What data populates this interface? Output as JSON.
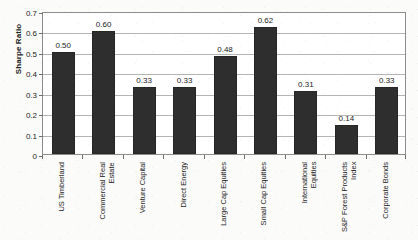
{
  "chart_data": {
    "type": "bar",
    "title": "",
    "xlabel": "",
    "ylabel": "Sharpe Ratio",
    "ylim": [
      0,
      0.7
    ],
    "ytick_step": 0.1,
    "ytick_labels": [
      "0.7",
      "0.6",
      "0.5",
      "0.4",
      "0.3",
      "0.2",
      "0.1",
      "0"
    ],
    "ytick_values": [
      0.7,
      0.6,
      0.5,
      0.4,
      0.3,
      0.2,
      0.1,
      0
    ],
    "grid": "horizontal",
    "legend": "none",
    "bar_color": "#2e2e2e",
    "categories": [
      "US Timberland",
      "Commercial Real Estate",
      "Venture Capital",
      "Direct Energy",
      "Large Cap Equities",
      "Small Cap Equities",
      "International Equities",
      "S&P Forest Products Index",
      "Corporate Bonds"
    ],
    "category_lines": [
      [
        "US Timberland"
      ],
      [
        "Commercial Real",
        "Estate"
      ],
      [
        "Venture Capital"
      ],
      [
        "Direct Energy"
      ],
      [
        "Large Cap Equities"
      ],
      [
        "Small Cap Equities"
      ],
      [
        "International",
        "Equities"
      ],
      [
        "S&P Forest Products",
        "Index"
      ],
      [
        "Corporate Bonds"
      ]
    ],
    "values": [
      0.5,
      0.6,
      0.33,
      0.33,
      0.48,
      0.62,
      0.31,
      0.14,
      0.33
    ],
    "data_labels": [
      "0.50",
      "0.60",
      "0.33",
      "0.33",
      "0.48",
      "0.62",
      "0.31",
      "0.14",
      "0.33"
    ]
  }
}
